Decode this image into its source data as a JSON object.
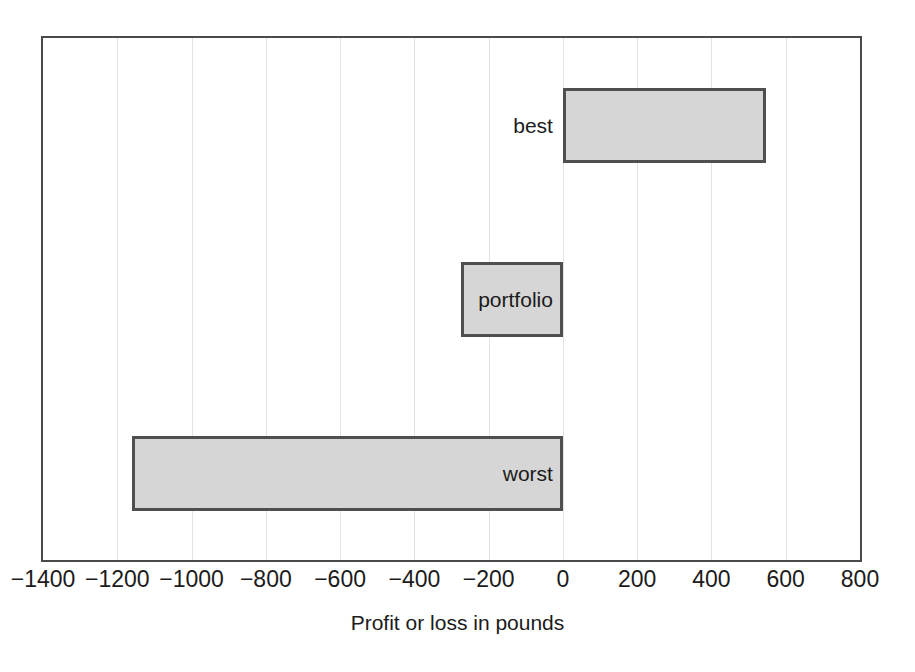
{
  "chart_data": {
    "type": "bar",
    "orientation": "horizontal",
    "title": "",
    "xlabel": "Profit or loss in pounds",
    "ylabel": "",
    "categories": [
      "best",
      "portfolio",
      "worst"
    ],
    "values": [
      547,
      -275,
      -1160
    ],
    "xlim": [
      -1400,
      800
    ],
    "xticks": [
      -1400,
      -1200,
      -1000,
      -800,
      -600,
      -400,
      -200,
      0,
      200,
      400,
      600,
      800
    ],
    "xtick_labels": [
      "−1400",
      "−1200",
      "−1000",
      "−800",
      "−600",
      "−400",
      "−200",
      "0",
      "200",
      "400",
      "600",
      "800"
    ],
    "grid": "vertical",
    "legend": "none",
    "baseline": 0,
    "bars": [
      {
        "label": "best",
        "value": 547,
        "start": 0,
        "end": 547,
        "label_position": "outside-left"
      },
      {
        "label": "portfolio",
        "value": -275,
        "start": -275,
        "end": 0,
        "label_position": "inside-center"
      },
      {
        "label": "worst",
        "value": -1160,
        "start": -1160,
        "end": 0,
        "label_position": "inside-right"
      }
    ],
    "colors": {
      "bar_fill": "#d6d6d6",
      "bar_edge": "#4f4f4f",
      "frame": "#4a4a4a",
      "gridline": "#e2e2e2",
      "text": "#1b1b1b",
      "background": "#ffffff"
    }
  }
}
